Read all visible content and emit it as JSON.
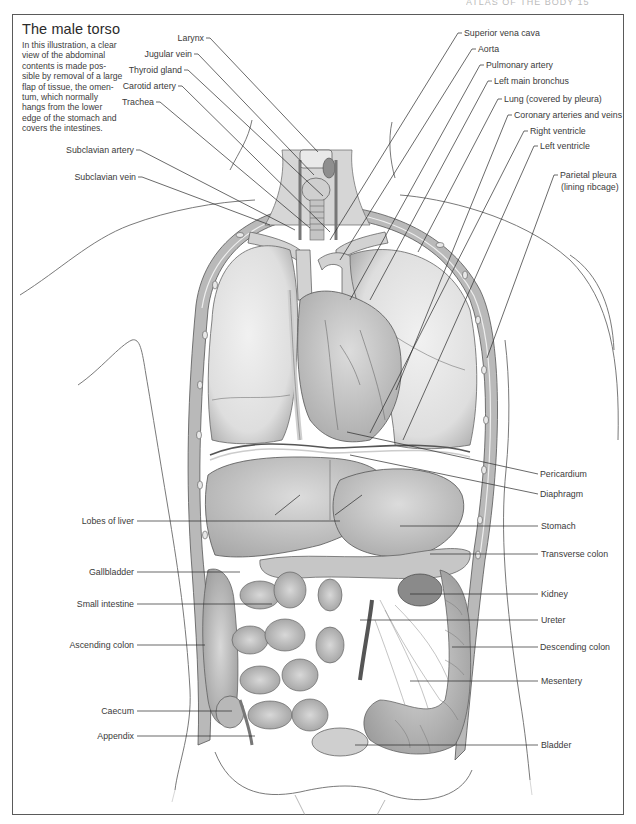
{
  "page": {
    "running_head": "ATLAS OF THE BODY 15"
  },
  "figure": {
    "title": "The male torso",
    "caption": "In this illustration, a clear view of the abdominal contents is made possible by removal of a large flap of tissue, the omentum, which normally hangs from the lower edge of the stomach and covers the intestines.",
    "caption_lines": [
      "In this illustration, a clear",
      "view of the abdominal",
      "contents is made pos-",
      "sible by removal of a large",
      "flap of tissue, the omen-",
      "tum, which normally",
      "hangs from the lower",
      "edge of the stomach and",
      "covers the intestines."
    ]
  },
  "labels_left": [
    {
      "text": "Larynx",
      "x": 204,
      "y": 33,
      "tx": 318,
      "ty": 152
    },
    {
      "text": "Jugular vein",
      "x": 192,
      "y": 50,
      "tx": 314,
      "ty": 175
    },
    {
      "text": "Thyroid gland",
      "x": 182,
      "y": 66,
      "tx": 323,
      "ty": 196
    },
    {
      "text": "Carotid artery",
      "x": 176,
      "y": 82,
      "tx": 330,
      "ty": 232
    },
    {
      "text": "Trachea",
      "x": 154,
      "y": 98,
      "tx": 310,
      "ty": 228
    },
    {
      "text": "Subclavian artery",
      "x": 134,
      "y": 146,
      "tx": 295,
      "ty": 230
    },
    {
      "text": "Subclavian vein",
      "x": 136,
      "y": 173,
      "tx": 270,
      "ty": 225
    },
    {
      "text": "Lobes of liver",
      "x": 135,
      "y": 516,
      "tx": 340,
      "ty": 516
    },
    {
      "text": "Gallbladder",
      "x": 135,
      "y": 567,
      "tx": 240,
      "ty": 567
    },
    {
      "text": "Small intestine",
      "x": 135,
      "y": 599,
      "tx": 272,
      "ty": 599
    },
    {
      "text": "Ascending colon",
      "x": 135,
      "y": 640,
      "tx": 205,
      "ty": 640
    },
    {
      "text": "Caecum",
      "x": 135,
      "y": 706,
      "tx": 232,
      "ty": 706
    },
    {
      "text": "Appendix",
      "x": 135,
      "y": 731,
      "tx": 255,
      "ty": 731
    }
  ],
  "labels_right": [
    {
      "text": "Superior vena cava",
      "x": 464,
      "y": 28,
      "tx": 330,
      "ty": 240
    },
    {
      "text": "Aorta",
      "x": 478,
      "y": 44,
      "tx": 340,
      "ty": 260
    },
    {
      "text": "Pulmonary artery",
      "x": 486,
      "y": 60,
      "tx": 350,
      "ty": 300
    },
    {
      "text": "Left main bronchus",
      "x": 494,
      "y": 76,
      "tx": 370,
      "ty": 300
    },
    {
      "text": "Lung (covered by pleura)",
      "x": 504,
      "y": 94,
      "tx": 418,
      "ty": 252
    },
    {
      "text": "Coronary arteries and veins",
      "x": 514,
      "y": 110,
      "tx": 396,
      "ty": 390
    },
    {
      "text": "Right ventricle",
      "x": 530,
      "y": 126,
      "tx": 370,
      "ty": 433
    },
    {
      "text": "Left ventricle",
      "x": 540,
      "y": 141,
      "tx": 403,
      "ty": 440
    },
    {
      "text": "Parietal pleura",
      "x": 560,
      "y": 170,
      "tx": 487,
      "ty": 358
    },
    {
      "text": "(lining ribcage)",
      "x": 561,
      "y": 182,
      "tx": null,
      "ty": null
    },
    {
      "text": "Pericardium",
      "x": 540,
      "y": 469,
      "tx": 347,
      "ty": 432
    },
    {
      "text": "Diaphragm",
      "x": 540,
      "y": 489,
      "tx": 350,
      "ty": 455
    },
    {
      "text": "Stomach",
      "x": 541,
      "y": 521,
      "tx": 400,
      "ty": 521
    },
    {
      "text": "Transverse colon",
      "x": 541,
      "y": 549,
      "tx": 430,
      "ty": 549
    },
    {
      "text": "Kidney",
      "x": 541,
      "y": 589,
      "tx": 410,
      "ty": 589
    },
    {
      "text": "Ureter",
      "x": 541,
      "y": 615,
      "tx": 360,
      "ty": 615
    },
    {
      "text": "Descending colon",
      "x": 540,
      "y": 642,
      "tx": 452,
      "ty": 642
    },
    {
      "text": "Mesentery",
      "x": 541,
      "y": 676,
      "tx": 410,
      "ty": 676
    },
    {
      "text": "Bladder",
      "x": 541,
      "y": 740,
      "tx": 355,
      "ty": 740
    }
  ],
  "colors": {
    "frame": "#5a5a5a",
    "text": "#3a3a3a",
    "leader": "#2a2a2a",
    "tissue_light": "#e4e4e4",
    "tissue_mid": "#c9c9c9",
    "tissue_dark": "#9a9a9a",
    "muscle_wall": "#b3b3b3"
  }
}
